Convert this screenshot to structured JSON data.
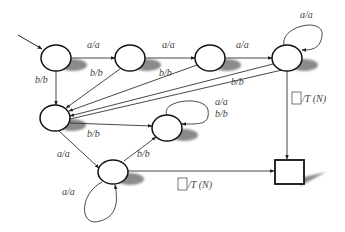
{
  "diagram": {
    "type": "finite-state-transducer",
    "colors": {
      "stroke": "#111111",
      "edge": "#333333",
      "shadow": "#8a8a8a",
      "label": "#444444",
      "background": "#ffffff"
    },
    "nodes": [
      {
        "id": "s0",
        "kind": "state",
        "cx": 56,
        "cy": 58,
        "initial": true
      },
      {
        "id": "s1",
        "kind": "state",
        "cx": 130,
        "cy": 58
      },
      {
        "id": "s2",
        "kind": "state",
        "cx": 210,
        "cy": 58
      },
      {
        "id": "s3",
        "kind": "state",
        "cx": 287,
        "cy": 58
      },
      {
        "id": "s4",
        "kind": "state",
        "cx": 55,
        "cy": 118
      },
      {
        "id": "s5",
        "kind": "state",
        "cx": 167,
        "cy": 128
      },
      {
        "id": "s6",
        "kind": "state",
        "cx": 113,
        "cy": 172
      },
      {
        "id": "final",
        "kind": "final-box",
        "x": 275,
        "y": 160,
        "w": 29,
        "h": 24
      }
    ],
    "edges": [
      {
        "from": "s0",
        "to": "s1",
        "label": "a/a"
      },
      {
        "from": "s1",
        "to": "s2",
        "label": "a/a"
      },
      {
        "from": "s2",
        "to": "s3",
        "label": "a/a"
      },
      {
        "from": "s3",
        "to": "s3",
        "label": "a/a",
        "self_loop": true
      },
      {
        "from": "s0",
        "to": "s4",
        "label": "b/b"
      },
      {
        "from": "s1",
        "to": "s4",
        "label": "b/b"
      },
      {
        "from": "s2",
        "to": "s4",
        "label": "b/b"
      },
      {
        "from": "s3",
        "to": "s4",
        "label": "b/b"
      },
      {
        "from": "s4",
        "to": "s5",
        "label": "b/b"
      },
      {
        "from": "s5",
        "to": "s5",
        "label": "a/a b/b",
        "self_loop": true
      },
      {
        "from": "s4",
        "to": "s6",
        "label": "a/a"
      },
      {
        "from": "s6",
        "to": "s6",
        "label": "a/a",
        "self_loop": true
      },
      {
        "from": "s6",
        "to": "s5",
        "label": "b/b"
      },
      {
        "from": "s3",
        "to": "final",
        "label": "□/T (N)"
      },
      {
        "from": "s6",
        "to": "final",
        "label": "□/T (N)"
      }
    ],
    "labels": {
      "e01": "a/a",
      "e12": "a/a",
      "e23": "a/a",
      "e33": "a/a",
      "e04": "b/b",
      "e14": "b/b",
      "e24": "b/b",
      "e34": "b/b",
      "e45": "b/b",
      "e55a": "a/a",
      "e55b": "b/b",
      "e46": "a/a",
      "e66": "a/a",
      "e65": "b/b",
      "e3f": "/T (N)",
      "e6f": "/T (N)"
    }
  }
}
